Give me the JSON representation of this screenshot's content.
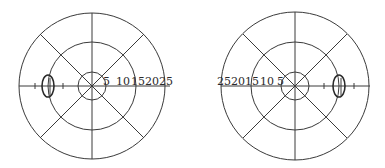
{
  "diagram": {
    "type": "visual-field-charts",
    "line_color": "#3a3a3a",
    "charts": [
      {
        "name": "left-eye-field",
        "center": [
          92,
          86
        ],
        "ring_radii": [
          14,
          44,
          73
        ],
        "scale_labels": [
          "5",
          "10",
          "15",
          "20",
          "25"
        ],
        "scale_side": "right",
        "blind_spot": {
          "cx": 48,
          "cy": 86,
          "rx": 6,
          "ry": 11
        }
      },
      {
        "name": "right-eye-field",
        "center": [
          295,
          86
        ],
        "ring_radii": [
          14,
          44,
          74
        ],
        "scale_labels": [
          "25",
          "20",
          "15",
          "10",
          "5"
        ],
        "scale_side": "left",
        "blind_spot": {
          "cx": 339,
          "cy": 86,
          "rx": 6,
          "ry": 11
        }
      }
    ]
  }
}
